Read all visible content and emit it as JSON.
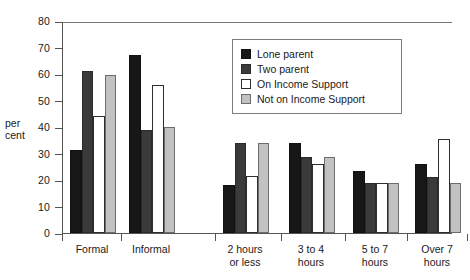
{
  "chart_data": {
    "type": "bar",
    "title": "",
    "subtitle": "",
    "xlabel": "",
    "ylabel": "per\ncent",
    "ylabel_lines": [
      "per",
      "cent"
    ],
    "ylim": [
      0,
      80
    ],
    "ytick_values": [
      0,
      10,
      20,
      30,
      40,
      50,
      60,
      70,
      80
    ],
    "ytick_labels": [
      "0",
      "10",
      "20",
      "30",
      "40",
      "50",
      "60",
      "70",
      "80"
    ],
    "grid": false,
    "legend_position": "upper-center-right",
    "categories": [
      "Formal",
      "Informal",
      "2 hours\nor less",
      "3 to 4\nhours",
      "5 to 7\nhours",
      "Over 7\nhours"
    ],
    "category_labels": [
      [
        "Formal"
      ],
      [
        "Informal"
      ],
      [
        "2 hours",
        "or less"
      ],
      [
        "3 to 4",
        "hours"
      ],
      [
        "5 to 7",
        "hours"
      ],
      [
        "Over 7",
        "hours"
      ]
    ],
    "group_gap_after_index": 1,
    "series": [
      {
        "name": "Lone parent",
        "color": "#171717",
        "values": [
          31.5,
          67,
          18,
          34,
          23.5,
          26
        ]
      },
      {
        "name": "Two parent",
        "color": "#3a3a3a",
        "values": [
          61,
          39,
          34,
          28.5,
          19,
          21
        ]
      },
      {
        "name": "On Income Support",
        "color": "#ffffff",
        "values": [
          44,
          56,
          21.5,
          26,
          19,
          35.5
        ]
      },
      {
        "name": "Not on Income Support",
        "color": "#c2c2c2",
        "values": [
          59.5,
          40,
          34,
          28.5,
          19,
          19
        ]
      }
    ]
  },
  "legend": {
    "items": [
      {
        "label": "Lone parent",
        "swatch": "legend-swatch-lone-parent"
      },
      {
        "label": "Two parent",
        "swatch": "legend-swatch-two-parent"
      },
      {
        "label": "On Income Support",
        "swatch": "legend-swatch-on-income-support"
      },
      {
        "label": "Not on Income Support",
        "swatch": "legend-swatch-not-on-income-support"
      }
    ]
  }
}
